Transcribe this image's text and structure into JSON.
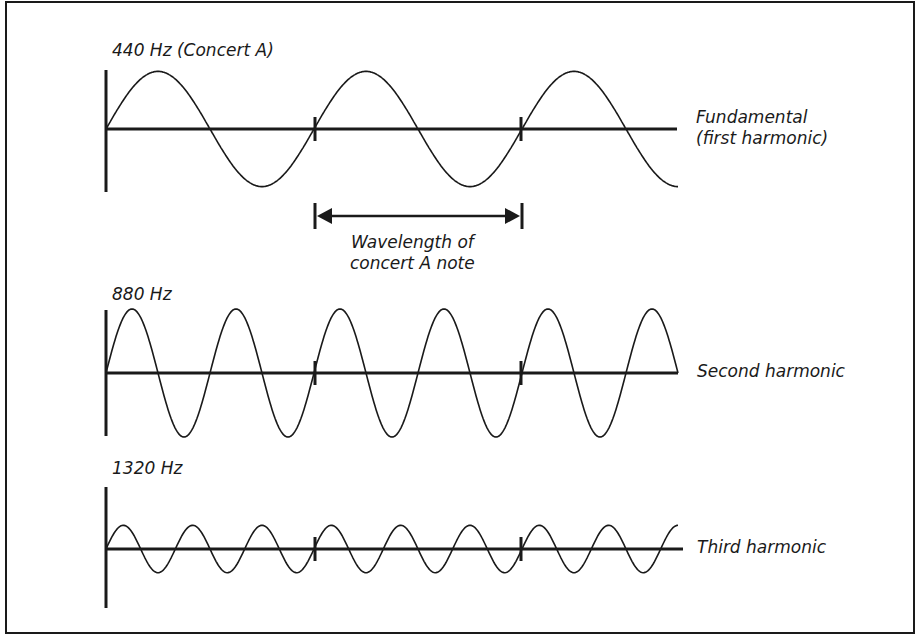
{
  "colors": {
    "ink": "#1a1a1a",
    "background": "#ffffff"
  },
  "rows": [
    {
      "freq_label": "440 Hz (Concert A)",
      "name_lines": [
        "Fundamental",
        "(first harmonic)"
      ],
      "frequency_hz": 440,
      "harmonic": 1,
      "cycles_shown": 2.75,
      "relative_amplitude": 0.9
    },
    {
      "freq_label": "880 Hz",
      "name_lines": [
        "Second harmonic"
      ],
      "frequency_hz": 880,
      "harmonic": 2,
      "cycles_shown": 5.5,
      "relative_amplitude": 1.0
    },
    {
      "freq_label": "1320 Hz",
      "name_lines": [
        "Third harmonic"
      ],
      "frequency_hz": 1320,
      "harmonic": 3,
      "cycles_shown": 8.25,
      "relative_amplitude": 0.37
    }
  ],
  "wavelength_annotation": {
    "line1": "Wavelength of",
    "line2": "concert A note"
  }
}
